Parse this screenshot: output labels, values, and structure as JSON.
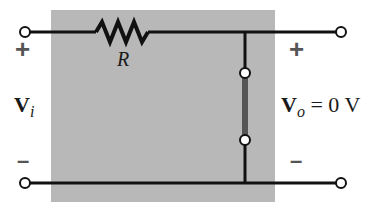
{
  "diagram": {
    "type": "circuit",
    "colors": {
      "background_box": "#b8b8b8",
      "wire": "#111111",
      "short_bar": "#555555",
      "terminal_fill": "#ffffff",
      "sign": "#555555"
    },
    "components": {
      "resistor": {
        "label": "R"
      },
      "short_circuit": {
        "label": ""
      }
    },
    "input": {
      "plus": "+",
      "minus": "–",
      "voltage_main": "V",
      "voltage_sub": "i"
    },
    "output": {
      "plus": "+",
      "minus": "–",
      "voltage_main": "V",
      "voltage_sub": "o",
      "voltage_rest": " = 0 V"
    }
  }
}
